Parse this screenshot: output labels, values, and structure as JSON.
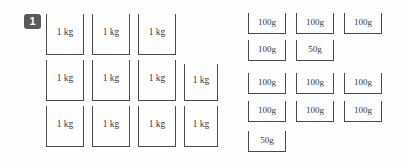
{
  "question": {
    "number": "1"
  },
  "colors": {
    "background": "#fefefe",
    "badge_bg": "#595959",
    "badge_text": "#ffffff",
    "weight_border": "#4a4a4a",
    "weight_text": "#3a3a3a"
  },
  "kg_group": {
    "name": "kilogram-weights",
    "unit": "kg",
    "count": 11,
    "rows": [
      {
        "weights": [
          {
            "label": "1 kg",
            "x": 46,
            "y": 14,
            "w": 38,
            "h": 41
          },
          {
            "label": "1 kg",
            "x": 92,
            "y": 14,
            "w": 38,
            "h": 41
          },
          {
            "label": "1 kg",
            "x": 138,
            "y": 14,
            "w": 38,
            "h": 41
          }
        ]
      },
      {
        "weights": [
          {
            "label": "1 kg",
            "x": 46,
            "y": 60,
            "w": 38,
            "h": 41
          },
          {
            "label": "1 kg",
            "x": 92,
            "y": 60,
            "w": 38,
            "h": 41
          },
          {
            "label": "1 kg",
            "x": 138,
            "y": 60,
            "w": 38,
            "h": 41
          },
          {
            "label": "1 kg",
            "x": 184,
            "y": 64,
            "w": 34,
            "h": 37
          }
        ]
      },
      {
        "weights": [
          {
            "label": "1 kg",
            "x": 46,
            "y": 106,
            "w": 38,
            "h": 41
          },
          {
            "label": "1 kg",
            "x": 92,
            "y": 106,
            "w": 38,
            "h": 41
          },
          {
            "label": "1 kg",
            "x": 138,
            "y": 106,
            "w": 38,
            "h": 41
          },
          {
            "label": "1 kg",
            "x": 184,
            "y": 106,
            "w": 34,
            "h": 41
          }
        ]
      }
    ]
  },
  "gram_group": {
    "name": "gram-weights",
    "unit": "g",
    "count": 12,
    "rows": [
      {
        "weights": [
          {
            "label": "100g",
            "x": 248,
            "y": 13,
            "w": 38,
            "h": 21
          },
          {
            "label": "100g",
            "x": 296,
            "y": 13,
            "w": 38,
            "h": 21
          },
          {
            "label": "100g",
            "x": 344,
            "y": 13,
            "w": 38,
            "h": 21
          }
        ]
      },
      {
        "weights": [
          {
            "label": "100g",
            "x": 248,
            "y": 40,
            "w": 38,
            "h": 21
          },
          {
            "label": "50g",
            "x": 296,
            "y": 40,
            "w": 38,
            "h": 21
          }
        ]
      },
      {
        "weights": [
          {
            "label": "100g",
            "x": 248,
            "y": 73,
            "w": 38,
            "h": 21
          },
          {
            "label": "100g",
            "x": 296,
            "y": 73,
            "w": 38,
            "h": 21
          },
          {
            "label": "100g",
            "x": 344,
            "y": 73,
            "w": 38,
            "h": 21
          }
        ]
      },
      {
        "weights": [
          {
            "label": "100g",
            "x": 248,
            "y": 101,
            "w": 38,
            "h": 21
          },
          {
            "label": "100g",
            "x": 296,
            "y": 101,
            "w": 38,
            "h": 21
          },
          {
            "label": "100g",
            "x": 344,
            "y": 101,
            "w": 38,
            "h": 21
          }
        ]
      },
      {
        "weights": [
          {
            "label": "50g",
            "x": 248,
            "y": 131,
            "w": 38,
            "h": 21
          }
        ]
      }
    ]
  }
}
